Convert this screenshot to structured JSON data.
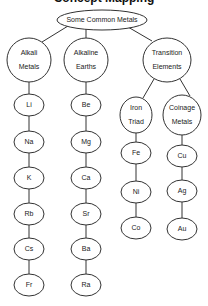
{
  "diagram": {
    "title_cropped": "Concept Mapping",
    "root": {
      "label": "Some Common Metals"
    },
    "groups": [
      {
        "label_line1": "Alkali",
        "label_line2": "Metals",
        "members": [
          "Li",
          "Na",
          "K",
          "Rb",
          "Cs",
          "Fr"
        ]
      },
      {
        "label_line1": "Alkaline",
        "label_line2": "Earths",
        "members": [
          "Be",
          "Mg",
          "Ca",
          "Sr",
          "Ba",
          "Ra"
        ]
      },
      {
        "label_line1": "Transition",
        "label_line2": "Elements",
        "subgroups": [
          {
            "label_line1": "Iron",
            "label_line2": "Triad",
            "members": [
              "Fe",
              "Ni",
              "Co"
            ]
          },
          {
            "label_line1": "Coinage",
            "label_line2": "Metals",
            "members": [
              "Cu",
              "Ag",
              "Au"
            ]
          }
        ]
      }
    ]
  }
}
